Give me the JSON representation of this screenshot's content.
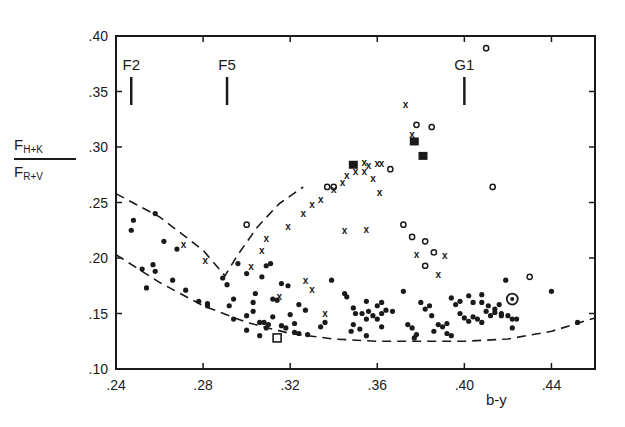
{
  "chart_data": {
    "type": "scatter",
    "title": "",
    "xlabel": "b-y",
    "ylabel": "F_H+K / F_R+V",
    "ylabel_numerator": "F",
    "ylabel_numerator_sub": "H+K",
    "ylabel_denominator": "F",
    "ylabel_denominator_sub": "R+V",
    "xlim": [
      0.24,
      0.46
    ],
    "ylim": [
      0.1,
      0.4
    ],
    "xticks": [
      ".24",
      ".28",
      ".32",
      ".36",
      ".40",
      ".44"
    ],
    "yticks": [
      ".10",
      ".15",
      ".20",
      ".25",
      ".30",
      ".35",
      ".40"
    ],
    "grid": false,
    "legend": null,
    "spectral_markers": [
      {
        "label": "F2",
        "x": 0.247
      },
      {
        "label": "F5",
        "x": 0.291
      },
      {
        "label": "G1",
        "x": 0.4
      }
    ],
    "boundary_curves": [
      {
        "name": "upper-v-boundary",
        "style": "dashed",
        "points": [
          [
            0.24,
            0.258
          ],
          [
            0.26,
            0.237
          ],
          [
            0.28,
            0.207
          ],
          [
            0.29,
            0.184
          ],
          [
            0.296,
            0.203
          ],
          [
            0.305,
            0.228
          ],
          [
            0.315,
            0.249
          ],
          [
            0.326,
            0.264
          ]
        ]
      },
      {
        "name": "lower-boundary",
        "style": "dashed",
        "points": [
          [
            0.24,
            0.203
          ],
          [
            0.26,
            0.178
          ],
          [
            0.28,
            0.157
          ],
          [
            0.3,
            0.142
          ],
          [
            0.32,
            0.132
          ],
          [
            0.34,
            0.127
          ],
          [
            0.36,
            0.125
          ],
          [
            0.38,
            0.125
          ],
          [
            0.4,
            0.125
          ],
          [
            0.42,
            0.127
          ],
          [
            0.44,
            0.134
          ],
          [
            0.46,
            0.146
          ]
        ]
      }
    ],
    "series": [
      {
        "name": "filled-dots",
        "symbol": "dot",
        "points": [
          [
            0.247,
            0.225
          ],
          [
            0.248,
            0.234
          ],
          [
            0.258,
            0.24
          ],
          [
            0.252,
            0.19
          ],
          [
            0.257,
            0.194
          ],
          [
            0.258,
            0.188
          ],
          [
            0.254,
            0.173
          ],
          [
            0.262,
            0.215
          ],
          [
            0.268,
            0.208
          ],
          [
            0.266,
            0.18
          ],
          [
            0.272,
            0.171
          ],
          [
            0.278,
            0.161
          ],
          [
            0.282,
            0.157
          ],
          [
            0.282,
            0.159
          ],
          [
            0.289,
            0.182
          ],
          [
            0.291,
            0.176
          ],
          [
            0.294,
            0.163
          ],
          [
            0.296,
            0.195
          ],
          [
            0.3,
            0.186
          ],
          [
            0.304,
            0.168
          ],
          [
            0.303,
            0.16
          ],
          [
            0.307,
            0.183
          ],
          [
            0.309,
            0.193
          ],
          [
            0.311,
            0.195
          ],
          [
            0.316,
            0.177
          ],
          [
            0.312,
            0.147
          ],
          [
            0.3,
            0.148
          ],
          [
            0.292,
            0.157
          ],
          [
            0.294,
            0.145
          ],
          [
            0.303,
            0.152
          ],
          [
            0.306,
            0.142
          ],
          [
            0.308,
            0.142
          ],
          [
            0.31,
            0.14
          ],
          [
            0.309,
            0.137
          ],
          [
            0.32,
            0.149
          ],
          [
            0.322,
            0.133
          ],
          [
            0.324,
            0.132
          ],
          [
            0.328,
            0.131
          ],
          [
            0.334,
            0.138
          ],
          [
            0.336,
            0.142
          ],
          [
            0.319,
            0.175
          ],
          [
            0.324,
            0.158
          ],
          [
            0.327,
            0.153
          ],
          [
            0.312,
            0.163
          ],
          [
            0.314,
            0.162
          ],
          [
            0.306,
            0.13
          ],
          [
            0.3,
            0.135
          ],
          [
            0.316,
            0.139
          ],
          [
            0.318,
            0.137
          ],
          [
            0.322,
            0.141
          ],
          [
            0.339,
            0.18
          ],
          [
            0.345,
            0.168
          ],
          [
            0.346,
            0.165
          ],
          [
            0.349,
            0.155
          ],
          [
            0.35,
            0.15
          ],
          [
            0.353,
            0.15
          ],
          [
            0.355,
            0.145
          ],
          [
            0.356,
            0.152
          ],
          [
            0.358,
            0.148
          ],
          [
            0.36,
            0.145
          ],
          [
            0.362,
            0.15
          ],
          [
            0.349,
            0.14
          ],
          [
            0.348,
            0.134
          ],
          [
            0.352,
            0.136
          ],
          [
            0.355,
            0.13
          ],
          [
            0.362,
            0.138
          ],
          [
            0.355,
            0.161
          ],
          [
            0.36,
            0.157
          ],
          [
            0.362,
            0.16
          ],
          [
            0.364,
            0.153
          ],
          [
            0.367,
            0.152
          ],
          [
            0.372,
            0.17
          ],
          [
            0.374,
            0.14
          ],
          [
            0.376,
            0.137
          ],
          [
            0.378,
            0.131
          ],
          [
            0.377,
            0.128
          ],
          [
            0.38,
            0.16
          ],
          [
            0.382,
            0.154
          ],
          [
            0.384,
            0.157
          ],
          [
            0.385,
            0.148
          ],
          [
            0.388,
            0.14
          ],
          [
            0.39,
            0.138
          ],
          [
            0.392,
            0.141
          ],
          [
            0.386,
            0.134
          ],
          [
            0.392,
            0.132
          ],
          [
            0.394,
            0.13
          ],
          [
            0.394,
            0.164
          ],
          [
            0.396,
            0.158
          ],
          [
            0.398,
            0.161
          ],
          [
            0.398,
            0.15
          ],
          [
            0.4,
            0.146
          ],
          [
            0.402,
            0.143
          ],
          [
            0.404,
            0.147
          ],
          [
            0.406,
            0.145
          ],
          [
            0.408,
            0.142
          ],
          [
            0.41,
            0.152
          ],
          [
            0.412,
            0.148
          ],
          [
            0.402,
            0.166
          ],
          [
            0.404,
            0.16
          ],
          [
            0.408,
            0.16
          ],
          [
            0.411,
            0.157
          ],
          [
            0.414,
            0.154
          ],
          [
            0.417,
            0.148
          ],
          [
            0.417,
            0.15
          ],
          [
            0.42,
            0.148
          ],
          [
            0.422,
            0.145
          ],
          [
            0.422,
            0.137
          ],
          [
            0.424,
            0.145
          ],
          [
            0.419,
            0.18
          ],
          [
            0.44,
            0.17
          ],
          [
            0.452,
            0.142
          ],
          [
            0.414,
            0.151
          ],
          [
            0.416,
            0.158
          ],
          [
            0.408,
            0.167
          ]
        ]
      },
      {
        "name": "crosses",
        "symbol": "x",
        "points": [
          [
            0.271,
            0.212
          ],
          [
            0.281,
            0.198
          ],
          [
            0.302,
            0.192
          ],
          [
            0.307,
            0.207
          ],
          [
            0.309,
            0.218
          ],
          [
            0.319,
            0.228
          ],
          [
            0.326,
            0.24
          ],
          [
            0.33,
            0.248
          ],
          [
            0.334,
            0.253
          ],
          [
            0.34,
            0.262
          ],
          [
            0.344,
            0.268
          ],
          [
            0.346,
            0.274
          ],
          [
            0.35,
            0.278
          ],
          [
            0.354,
            0.286
          ],
          [
            0.354,
            0.278
          ],
          [
            0.36,
            0.285
          ],
          [
            0.362,
            0.285
          ],
          [
            0.358,
            0.272
          ],
          [
            0.356,
            0.283
          ],
          [
            0.361,
            0.259
          ],
          [
            0.376,
            0.311
          ],
          [
            0.373,
            0.338
          ],
          [
            0.355,
            0.226
          ],
          [
            0.345,
            0.225
          ],
          [
            0.378,
            0.203
          ],
          [
            0.388,
            0.185
          ],
          [
            0.391,
            0.202
          ],
          [
            0.327,
            0.18
          ],
          [
            0.33,
            0.172
          ],
          [
            0.315,
            0.165
          ],
          [
            0.336,
            0.15
          ]
        ]
      },
      {
        "name": "open-circles",
        "symbol": "circle",
        "points": [
          [
            0.3,
            0.23
          ],
          [
            0.337,
            0.264
          ],
          [
            0.34,
            0.264
          ],
          [
            0.366,
            0.28
          ],
          [
            0.378,
            0.32
          ],
          [
            0.385,
            0.318
          ],
          [
            0.41,
            0.389
          ],
          [
            0.372,
            0.23
          ],
          [
            0.376,
            0.219
          ],
          [
            0.382,
            0.215
          ],
          [
            0.386,
            0.205
          ],
          [
            0.382,
            0.193
          ],
          [
            0.413,
            0.264
          ],
          [
            0.43,
            0.183
          ]
        ]
      },
      {
        "name": "filled-squares",
        "symbol": "square",
        "points": [
          [
            0.349,
            0.284
          ],
          [
            0.377,
            0.305
          ],
          [
            0.381,
            0.292
          ]
        ]
      },
      {
        "name": "open-square",
        "symbol": "open-square",
        "points": [
          [
            0.314,
            0.128
          ]
        ]
      },
      {
        "name": "ringed-dot",
        "symbol": "ringed-dot",
        "points": [
          [
            0.422,
            0.163
          ]
        ]
      }
    ]
  }
}
